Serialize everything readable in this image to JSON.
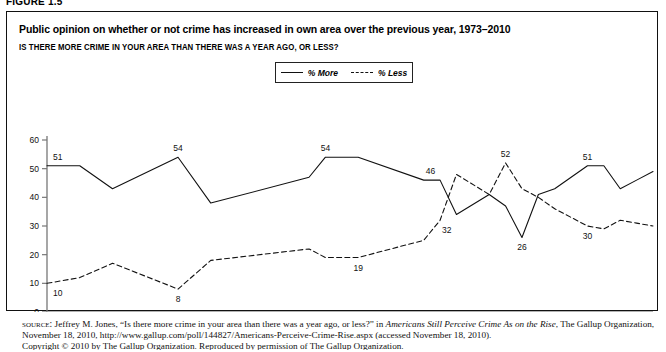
{
  "figure": {
    "tag": "FIGURE 1.5",
    "title": "Public opinion on whether or not crime has increased in own area over the previous year, 1973–2010",
    "subtitle": "IS THERE MORE CRIME IN YOUR AREA THAN THERE WAS A YEAR AGO, OR LESS?"
  },
  "legend": {
    "position": "top-center",
    "items": [
      {
        "label": "% More",
        "style": "solid",
        "color": "#111111"
      },
      {
        "label": "% Less",
        "style": "dashed",
        "color": "#111111"
      }
    ]
  },
  "source": {
    "line_html": "<span class=\"sc\">source:</span> Jeffrey M. Jones, “Is there more crime in your area than there was a year ago, or less?” in <i>Americans Still Perceive Crime As on the Rise</i>, The Gallup Organization, November 18, 2010, http://www.gallup.com/poll/144827/Americans-Perceive-Crime-Rise.aspx (accessed November 18, 2010).",
    "copyright_html": "Copyright © 2010 by The Gallup Organization. Reproduced by permission of The Gallup Organization."
  },
  "chart_data": {
    "type": "line",
    "title": "Public opinion on whether or not crime has increased in own area over the previous year, 1973–2010",
    "xlabel": "",
    "ylabel": "",
    "xlim": [
      1973,
      2010
    ],
    "ylim": [
      0,
      60
    ],
    "ytick_labels": [
      "0",
      "10",
      "20",
      "30",
      "40",
      "50",
      "60"
    ],
    "yticks": [
      0,
      10,
      20,
      30,
      40,
      50,
      60
    ],
    "xtick_labels": [
      "1973",
      "1976",
      "1979",
      "1982",
      "1985",
      "1988",
      "1991",
      "1994",
      "1997",
      "2000",
      "2003",
      "2006",
      "2009"
    ],
    "xticks": [
      1973,
      1976,
      1979,
      1982,
      1985,
      1988,
      1991,
      1994,
      1997,
      2000,
      2003,
      2006,
      2009
    ],
    "grid": false,
    "legend_position": "top-center",
    "series": [
      {
        "name": "% More",
        "style": "solid",
        "x": [
          1973,
          1975,
          1977,
          1981,
          1983,
          1989,
          1990,
          1992,
          1996,
          1997,
          1998,
          2000,
          2001,
          2002,
          2003,
          2004,
          2005,
          2006,
          2007,
          2008,
          2009,
          2010
        ],
        "values": [
          51,
          51,
          43,
          54,
          38,
          47,
          54,
          54,
          46,
          46,
          34,
          41,
          37,
          26,
          41,
          43,
          47,
          51,
          51,
          43,
          46,
          49
        ]
      },
      {
        "name": "% Less",
        "style": "dashed",
        "x": [
          1973,
          1975,
          1977,
          1981,
          1983,
          1989,
          1990,
          1992,
          1996,
          1997,
          1998,
          2000,
          2001,
          2002,
          2003,
          2004,
          2005,
          2006,
          2007,
          2008,
          2009,
          2010
        ],
        "values": [
          10,
          12,
          17,
          8,
          18,
          22,
          19,
          19,
          25,
          32,
          48,
          41,
          52,
          43,
          40,
          36,
          33,
          30,
          29,
          32,
          31,
          30
        ]
      }
    ],
    "point_labels": [
      {
        "series": "% More",
        "x": 1973,
        "value": 51,
        "text": "51"
      },
      {
        "series": "% More",
        "x": 1981,
        "value": 54,
        "text": "54"
      },
      {
        "series": "% More",
        "x": 1990,
        "value": 54,
        "text": "54"
      },
      {
        "series": "% More",
        "x": 1996,
        "value": 46,
        "text": "46"
      },
      {
        "series": "% More",
        "x": 2002,
        "value": 26,
        "text": "26"
      },
      {
        "series": "% More",
        "x": 2006,
        "value": 51,
        "text": "51"
      },
      {
        "series": "% More",
        "x": 2010,
        "value": 49,
        "text": "49"
      },
      {
        "series": "% Less",
        "x": 1973,
        "value": 10,
        "text": "10"
      },
      {
        "series": "% Less",
        "x": 1981,
        "value": 8,
        "text": "8"
      },
      {
        "series": "% Less",
        "x": 1992,
        "value": 19,
        "text": "19"
      },
      {
        "series": "% Less",
        "x": 1997,
        "value": 32,
        "text": "32"
      },
      {
        "series": "% Less",
        "x": 2001,
        "value": 52,
        "text": "52"
      },
      {
        "series": "% Less",
        "x": 2006,
        "value": 30,
        "text": "30"
      },
      {
        "series": "% Less",
        "x": 2010,
        "value": 30,
        "text": "30"
      }
    ]
  }
}
